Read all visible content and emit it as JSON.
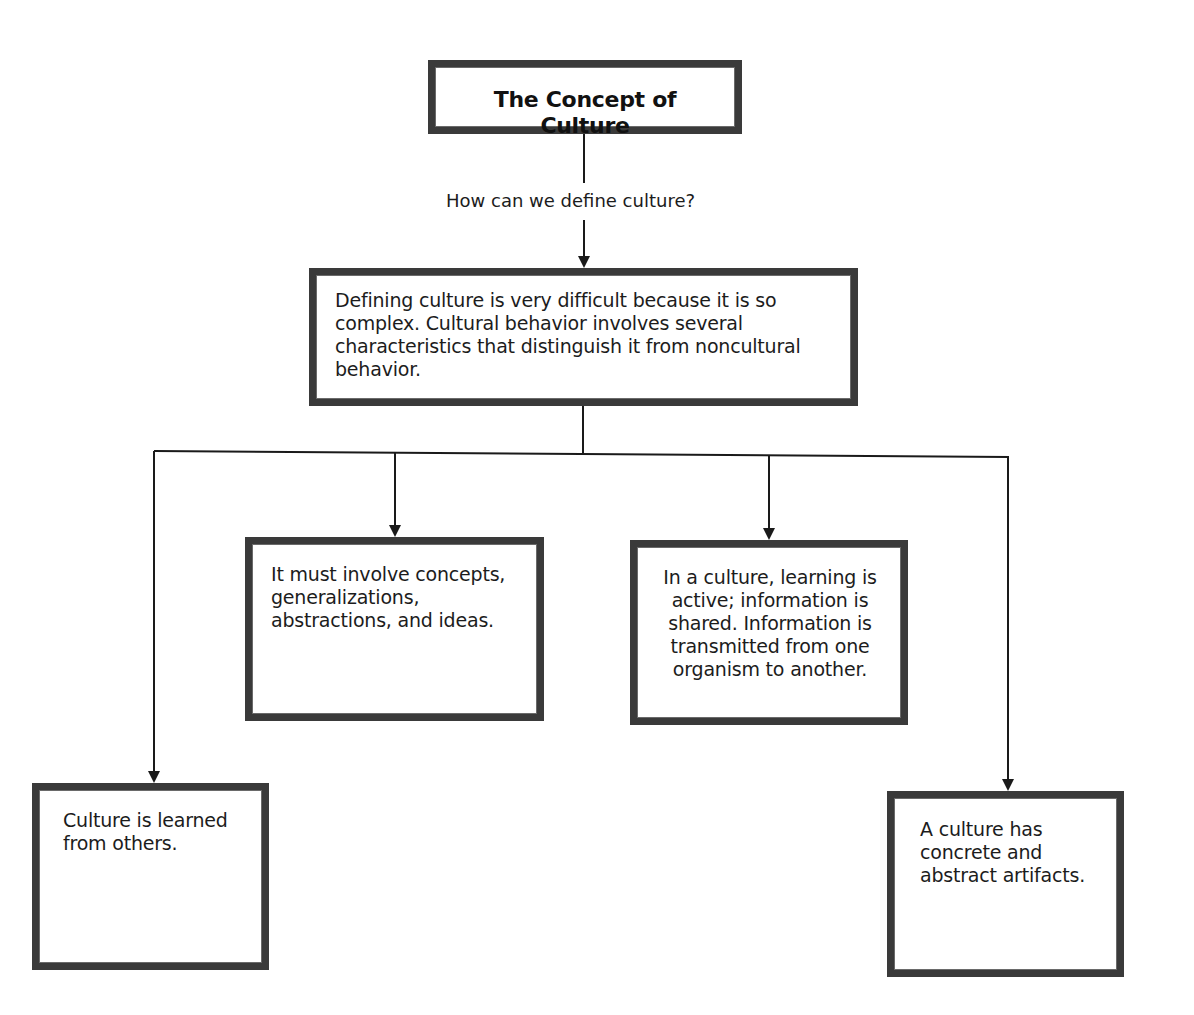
{
  "diagram": {
    "type": "concept-map",
    "title": "The Concept of Culture",
    "question": "How can we define culture?",
    "definition": "Defining culture is very difficult because it is so complex. Cultural behavior involves several characteristics that distinguish it from noncultural behavior.",
    "characteristics": [
      {
        "id": "learned",
        "text": "Culture is learned from others."
      },
      {
        "id": "concepts",
        "text": "It must involve concepts, generalizations, abstractions, and ideas."
      },
      {
        "id": "shared",
        "text": "In a culture, learning is active; information is shared. Information is transmitted from one organism to another."
      },
      {
        "id": "artifacts",
        "text": "A culture has concrete and abstract artifacts."
      }
    ],
    "colors": {
      "border": "#3a3a3a",
      "line": "#1a1a1a",
      "text": "#1c1c1c",
      "background": "#ffffff"
    }
  }
}
